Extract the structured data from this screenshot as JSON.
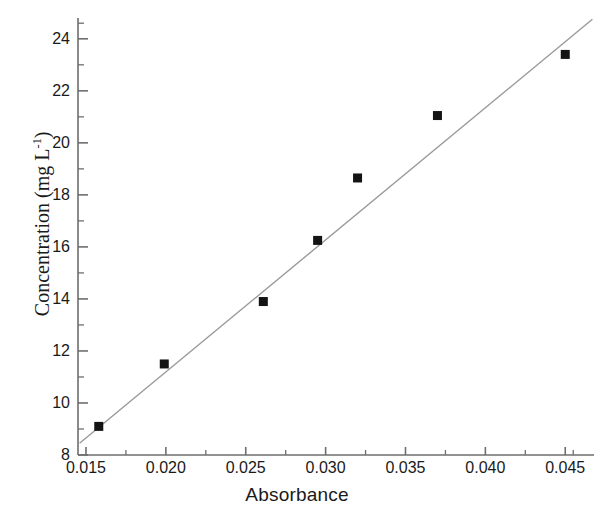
{
  "chart_data": {
    "type": "scatter",
    "title": "",
    "subtitle": "",
    "xlabel": "Absorbance",
    "ylabel": "Concentration (mg L-1)",
    "ylabel_base": "Concentration (mg L",
    "ylabel_sup": "-1",
    "ylabel_tail": ")",
    "xlim": [
      0.0145,
      0.0468
    ],
    "ylim": [
      8,
      24.8
    ],
    "grid": false,
    "legend": null,
    "xticks": [
      0.015,
      0.02,
      0.025,
      0.03,
      0.035,
      0.04,
      0.045
    ],
    "xticklabels": [
      "0.015",
      "0.020",
      "0.025",
      "0.030",
      "0.035",
      "0.040",
      "0.045"
    ],
    "yticks": [
      8,
      10,
      12,
      14,
      16,
      18,
      20,
      22,
      24
    ],
    "yticklabels": [
      "8",
      "10",
      "12",
      "14",
      "16",
      "18",
      "20",
      "22",
      "24"
    ],
    "minor_xticks": [
      0.0175,
      0.0225,
      0.0275,
      0.0325,
      0.0375,
      0.0425,
      0.0455
    ],
    "minor_yticks": [
      9,
      11,
      13,
      15,
      17,
      19,
      21,
      23,
      24.6
    ],
    "marker": "square",
    "marker_color": "#141414",
    "marker_size": 9,
    "line_color": "#9a9a9a",
    "axis_color": "#6e6e6e",
    "series": [
      {
        "name": "Calibration points",
        "x": [
          0.0158,
          0.0199,
          0.0261,
          0.0295,
          0.032,
          0.037,
          0.045
        ],
        "y": [
          9.1,
          11.5,
          13.9,
          16.25,
          18.65,
          21.05,
          23.4
        ]
      }
    ],
    "fit_line": {
      "name": "Linear regression",
      "x": [
        0.0146,
        0.0467
      ],
      "y": [
        8.45,
        24.75
      ]
    }
  }
}
